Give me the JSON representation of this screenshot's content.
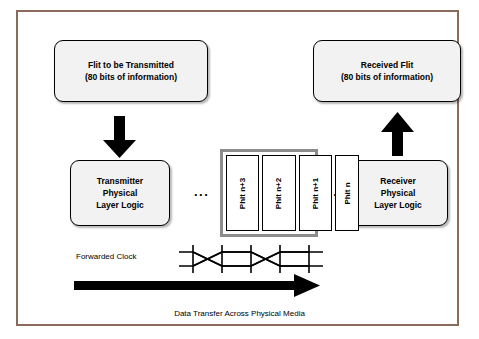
{
  "figure": {
    "caption": "Data Transfer Across Physical Media",
    "forwarded_clock_label": "Forwarded Clock",
    "ellipsis_left": "...",
    "ellipsis_right": "...",
    "frame_color": "#8a6a5a"
  },
  "boxes": {
    "flit_transmitted": {
      "line1": "Flit to be Transmitted",
      "line2": "(80 bits of information)"
    },
    "received_flit": {
      "line1": "Received Flit",
      "line2": "(80 bits of information)"
    },
    "transmitter": {
      "line1": "Transmitter",
      "line2": "Physical",
      "line3": "Layer Logic"
    },
    "receiver": {
      "line1": "Receiver",
      "line2": "Physical",
      "line3": "Layer Logic"
    }
  },
  "phits": [
    {
      "label": "Phit n+3"
    },
    {
      "label": "Phit n+2"
    },
    {
      "label": "Phit n+1"
    },
    {
      "label": "Phit n"
    }
  ],
  "arrows": {
    "down_left": "down-arrow",
    "up_right": "up-arrow",
    "data_flow": "right-arrow"
  },
  "colors": {
    "box_fill": "#f2f2f2",
    "box_border": "#000000",
    "stack_border": "#8c8c8c",
    "arrow": "#000000",
    "frame": "#8a6a5a"
  }
}
